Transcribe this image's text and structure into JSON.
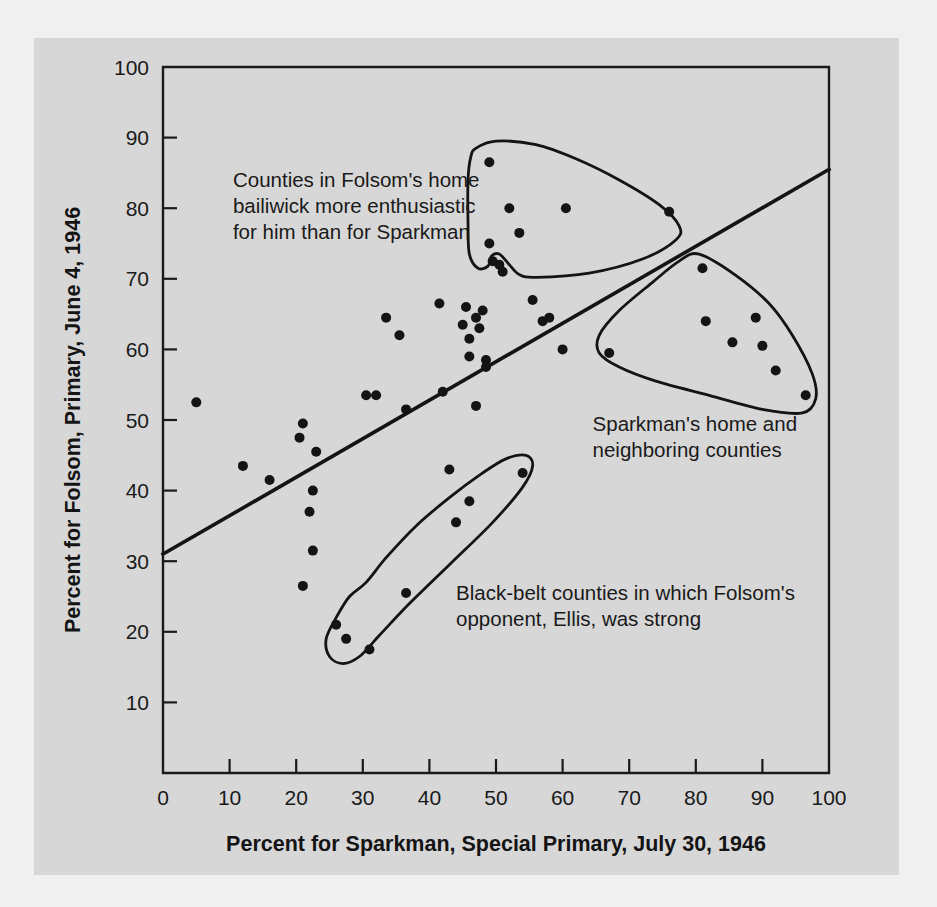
{
  "figure": {
    "background_color": "#f0f0f0",
    "panel_color": "#d7d7d7",
    "ink_color": "#141414"
  },
  "chart_data": {
    "type": "scatter",
    "title": "",
    "subtitle": "",
    "xlabel": "Percent for Sparkman, Special Primary, July 30, 1946",
    "ylabel": "Percent for Folsom, Primary, June 4, 1946",
    "xlim": [
      0,
      100
    ],
    "ylim": [
      0,
      100
    ],
    "xticks": [
      0,
      10,
      20,
      30,
      40,
      50,
      60,
      70,
      80,
      90,
      100
    ],
    "yticks": [
      0,
      10,
      20,
      30,
      40,
      50,
      60,
      70,
      80,
      90,
      100
    ],
    "xtick_labels": [
      "0",
      "10",
      "20",
      "30",
      "40",
      "50",
      "60",
      "70",
      "80",
      "90",
      "100"
    ],
    "ytick_labels": [
      "0",
      "10",
      "20",
      "30",
      "40",
      "50",
      "60",
      "70",
      "80",
      "90",
      "100"
    ],
    "grid": false,
    "legend": false,
    "legend_position": "none",
    "point_color": "#141414",
    "point_radius": 5.0,
    "series": [
      {
        "name": "Alabama counties",
        "points": [
          [
            5.0,
            52.5
          ],
          [
            12.0,
            43.5
          ],
          [
            16.0,
            41.5
          ],
          [
            20.5,
            47.5
          ],
          [
            21.0,
            49.5
          ],
          [
            21.0,
            26.5
          ],
          [
            22.5,
            40.0
          ],
          [
            23.0,
            45.5
          ],
          [
            22.0,
            37.0
          ],
          [
            22.5,
            31.5
          ],
          [
            26.0,
            21.0
          ],
          [
            27.5,
            19.0
          ],
          [
            30.5,
            53.5
          ],
          [
            32.0,
            53.5
          ],
          [
            31.0,
            17.5
          ],
          [
            33.5,
            64.5
          ],
          [
            35.5,
            62.0
          ],
          [
            36.5,
            51.5
          ],
          [
            36.5,
            25.5
          ],
          [
            41.5,
            66.5
          ],
          [
            42.0,
            54.0
          ],
          [
            43.0,
            43.0
          ],
          [
            44.0,
            35.5
          ],
          [
            45.0,
            63.5
          ],
          [
            45.5,
            66.0
          ],
          [
            46.0,
            61.5
          ],
          [
            46.0,
            59.0
          ],
          [
            47.0,
            64.5
          ],
          [
            47.5,
            63.0
          ],
          [
            48.0,
            65.5
          ],
          [
            48.5,
            58.5
          ],
          [
            48.5,
            57.5
          ],
          [
            46.0,
            38.5
          ],
          [
            47.0,
            52.0
          ],
          [
            49.0,
            86.5
          ],
          [
            49.0,
            75.0
          ],
          [
            49.5,
            72.5
          ],
          [
            50.5,
            72.0
          ],
          [
            51.0,
            71.0
          ],
          [
            52.0,
            80.0
          ],
          [
            53.5,
            76.5
          ],
          [
            54.0,
            42.5
          ],
          [
            55.5,
            67.0
          ],
          [
            57.0,
            64.0
          ],
          [
            58.0,
            64.5
          ],
          [
            60.0,
            60.0
          ],
          [
            60.5,
            80.0
          ],
          [
            67.0,
            59.5
          ],
          [
            76.0,
            79.5
          ],
          [
            81.0,
            71.5
          ],
          [
            81.5,
            64.0
          ],
          [
            85.5,
            61.0
          ],
          [
            89.0,
            64.5
          ],
          [
            90.0,
            60.5
          ],
          [
            92.0,
            57.0
          ],
          [
            96.5,
            53.5
          ]
        ]
      }
    ],
    "trend_line": {
      "name": "regression line",
      "x_start": 0,
      "y_start": 31,
      "x_end": 100,
      "y_end": 85.5
    },
    "annotations": [
      {
        "id": "folsom-bailiwick",
        "lines": [
          "Counties in Folsom's home",
          "bailiwick more enthusiastic",
          "for him than for Sparkman"
        ],
        "x": 10.5,
        "y": 83.0
      },
      {
        "id": "sparkman-home",
        "lines": [
          "Sparkman's home and",
          "neighboring counties"
        ],
        "x": 64.5,
        "y": 48.5
      },
      {
        "id": "black-belt",
        "lines": [
          "Black-belt counties in which Folsom's",
          "opponent, Ellis, was strong"
        ],
        "x": 44.0,
        "y": 24.5
      }
    ],
    "cluster_outlines": [
      {
        "id": "folsom-bailiwick-outline",
        "label": "Counties in Folsom's home bailiwick",
        "points": [
          [
            47.0,
            88.5
          ],
          [
            50.0,
            89.5
          ],
          [
            56.0,
            89.0
          ],
          [
            62.0,
            87.0
          ],
          [
            68.5,
            84.0
          ],
          [
            74.5,
            80.5
          ],
          [
            77.5,
            77.5
          ],
          [
            77.0,
            75.5
          ],
          [
            72.0,
            72.8
          ],
          [
            64.0,
            70.8
          ],
          [
            56.0,
            70.2
          ],
          [
            53.5,
            70.6
          ],
          [
            52.0,
            72.0
          ],
          [
            50.5,
            73.5
          ],
          [
            49.3,
            73.2
          ],
          [
            48.8,
            71.8
          ],
          [
            47.3,
            71.5
          ],
          [
            46.0,
            73.5
          ],
          [
            45.8,
            78.0
          ],
          [
            45.8,
            84.0
          ],
          [
            46.2,
            87.2
          ]
        ]
      },
      {
        "id": "sparkman-home-outline",
        "label": "Sparkman's home and neighboring counties",
        "points": [
          [
            80.5,
            73.5
          ],
          [
            86.0,
            70.5
          ],
          [
            91.0,
            66.5
          ],
          [
            94.5,
            62.0
          ],
          [
            97.5,
            56.5
          ],
          [
            98.0,
            53.0
          ],
          [
            96.0,
            51.0
          ],
          [
            90.0,
            51.5
          ],
          [
            82.0,
            53.5
          ],
          [
            74.0,
            55.5
          ],
          [
            68.5,
            57.5
          ],
          [
            65.5,
            59.5
          ],
          [
            65.5,
            62.0
          ],
          [
            68.5,
            65.5
          ],
          [
            73.5,
            69.5
          ],
          [
            77.5,
            72.5
          ]
        ]
      },
      {
        "id": "black-belt-outline",
        "label": "Black-belt counties where Ellis was strong",
        "points": [
          [
            30.5,
            27.0
          ],
          [
            33.5,
            30.5
          ],
          [
            38.0,
            35.0
          ],
          [
            43.0,
            39.0
          ],
          [
            48.0,
            42.5
          ],
          [
            51.5,
            44.5
          ],
          [
            54.5,
            45.0
          ],
          [
            55.5,
            43.5
          ],
          [
            54.0,
            40.5
          ],
          [
            49.5,
            35.5
          ],
          [
            43.0,
            29.5
          ],
          [
            37.0,
            24.0
          ],
          [
            32.5,
            19.5
          ],
          [
            29.5,
            16.5
          ],
          [
            27.0,
            15.5
          ],
          [
            25.0,
            16.5
          ],
          [
            24.5,
            19.0
          ],
          [
            26.0,
            22.0
          ],
          [
            28.0,
            25.0
          ]
        ]
      }
    ]
  }
}
